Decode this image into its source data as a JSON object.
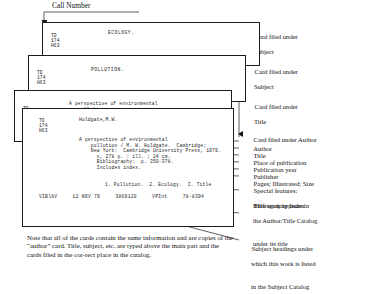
{
  "figure": {
    "callnumber_label": "Call Number",
    "note": "Note that all of the cards contain the same information and are copies of the “author” card. Title, subject, etc. are typed above the main part and the cards filed in the cor-rect place in the catalog."
  },
  "cards": {
    "ecology": {
      "heading": "ECOLOGY.",
      "call_number": "TD\n174\nH63"
    },
    "pollution": {
      "heading": "POLLUTION.",
      "call_number": "TD\n174\nH63"
    },
    "title": {
      "heading": "A perspective of environmental\n   pollution",
      "call_number": "TD\n174\nH63"
    },
    "author": {
      "call_number": "TD\n174\nH63",
      "author_heading": "Holdgate,M.W.",
      "body_lines": "A perspective of environmental\n    pollution / M. W. Holdgate.  Cambridge;\n    New York:  Cambridge University Press, 1979.\n      x, 278 p. : ill. ; 24 cm.\n      Bibliography:  p. 350-378.\n      Includes index.",
      "tracings": "1. Pollution.  2. Ecology.  I. Title",
      "footer_fields": [
        "VIBlbV",
        "12 NOV 79",
        "3869120",
        "VPInt",
        "78-8394"
      ],
      "footer_line": "VIBlbV     12 NOV 79     3869120     VPInt     78-8394"
    }
  },
  "annotations": [
    {
      "name": "card-filed-under-subject-1",
      "marker": "hollow",
      "line1": "Card filed under",
      "line2": "Subject"
    },
    {
      "name": "card-filed-under-subject-2",
      "marker": "hollow",
      "line1": "Card filed under",
      "line2": "Subject"
    },
    {
      "name": "card-filed-under-title",
      "marker": "hollow",
      "line1": "Card filed under",
      "line2": "Title"
    },
    {
      "name": "card-filed-under-author",
      "marker": "solid",
      "line1": "Card filed under Author",
      "line2": ""
    }
  ],
  "field_labels": [
    {
      "name": "author",
      "line1": "Author",
      "line2": "",
      "line3": ""
    },
    {
      "name": "title",
      "line1": "Title",
      "line2": "",
      "line3": ""
    },
    {
      "name": "place-of-publication",
      "line1": "Place of publication",
      "line2": "",
      "line3": ""
    },
    {
      "name": "publication-year",
      "line1": "Publication year",
      "line2": "",
      "line3": ""
    },
    {
      "name": "publisher",
      "line1": "Publisher",
      "line2": "",
      "line3": ""
    },
    {
      "name": "pages-illustrated-size",
      "line1": "Pages; Illustrated; Size",
      "line2": "",
      "line3": ""
    },
    {
      "name": "special-features",
      "line1": "Special features:",
      "line2": "Bibliography Index",
      "line3": ""
    },
    {
      "name": "work-appears-in-author-title-catalog",
      "line1": "This work appears in",
      "line2": "the Author/Title Catalog",
      "line3": "under its title"
    },
    {
      "name": "subject-headings",
      "line1": "Subject headings under",
      "line2": "which this work is listed",
      "line3": "in the Subject Catalog"
    }
  ],
  "colors": {
    "ink": "#111111",
    "card_border": "#1a1a1a",
    "paper": "#ffffff"
  }
}
